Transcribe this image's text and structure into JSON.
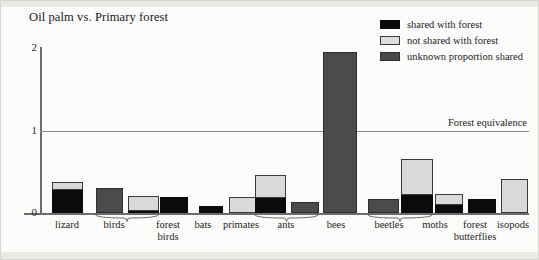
{
  "chart_data": {
    "type": "bar",
    "title": "Oil palm vs. Primary forest",
    "xlabel": "",
    "ylabel": "",
    "ylim": [
      0,
      2.1
    ],
    "yticks": [
      0,
      1,
      2
    ],
    "ytick_labels": [
      "0",
      "1",
      "2"
    ],
    "grid": false,
    "stacked": true,
    "legend_position": "top-right",
    "annotations": [
      {
        "name": "forest-equivalence",
        "label": "Forest equivalence",
        "y": 1
      }
    ],
    "legend": [
      {
        "key": "shared",
        "label": "shared with forest",
        "color": "#0b0b0b"
      },
      {
        "key": "notshared",
        "label": "not shared with forest",
        "color": "#d9d9d7"
      },
      {
        "key": "unknown",
        "label": "unknown proportion shared",
        "color": "#4b4b4b"
      }
    ],
    "categories": [
      "lizard",
      "birds",
      "forest birds",
      "bats",
      "primates",
      "ants",
      "bees",
      "beetles",
      "moths",
      "forest butterflies",
      "isopods"
    ],
    "groups": [
      {
        "label": "birds",
        "bars": 2
      },
      {
        "label": "ants",
        "bars": 2
      },
      {
        "label": "beetles",
        "bars": 2
      }
    ],
    "bars": [
      {
        "name": "lizard",
        "label": "lizard",
        "shared": 0.28,
        "notshared": 0.09,
        "unknown": 0,
        "total": 0.37
      },
      {
        "name": "birds-1",
        "label": "birds",
        "shared": 0,
        "notshared": 0,
        "unknown": 0.3,
        "total": 0.3
      },
      {
        "name": "birds-2",
        "label": "birds",
        "shared": 0.02,
        "notshared": 0.19,
        "unknown": 0,
        "total": 0.21
      },
      {
        "name": "forest-birds",
        "label": "forest birds",
        "shared": 0.2,
        "notshared": 0,
        "unknown": 0,
        "total": 0.2
      },
      {
        "name": "bats",
        "label": "bats",
        "shared": 0.09,
        "notshared": 0,
        "unknown": 0,
        "total": 0.09
      },
      {
        "name": "primates",
        "label": "primates",
        "shared": 0,
        "notshared": 0.2,
        "unknown": 0,
        "total": 0.2
      },
      {
        "name": "ants-1",
        "label": "ants",
        "shared": 0.18,
        "notshared": 0.28,
        "unknown": 0,
        "total": 0.46
      },
      {
        "name": "ants-2",
        "label": "ants",
        "shared": 0,
        "notshared": 0,
        "unknown": 0.13,
        "total": 0.13
      },
      {
        "name": "bees",
        "label": "bees",
        "shared": 0,
        "notshared": 0,
        "unknown": 1.95,
        "total": 1.95
      },
      {
        "name": "beetles-1",
        "label": "beetles",
        "shared": 0,
        "notshared": 0,
        "unknown": 0.17,
        "total": 0.17
      },
      {
        "name": "beetles-2",
        "label": "beetles",
        "shared": 0.22,
        "notshared": 0.44,
        "unknown": 0,
        "total": 0.66
      },
      {
        "name": "moths",
        "label": "moths",
        "shared": 0.1,
        "notshared": 0.13,
        "unknown": 0,
        "total": 0.23
      },
      {
        "name": "forest-butterflies",
        "label": "forest butterflies",
        "shared": 0.17,
        "notshared": 0,
        "unknown": 0,
        "total": 0.17
      },
      {
        "name": "isopods",
        "label": "isopods",
        "shared": 0,
        "notshared": 0.41,
        "unknown": 0,
        "total": 0.41
      }
    ],
    "axis_labels": [
      {
        "name": "lizard",
        "line1": "lizard",
        "line2": "",
        "x": 66
      },
      {
        "name": "birds",
        "line1": "birds",
        "line2": "",
        "x": 113
      },
      {
        "name": "forest-birds",
        "line1": "forest",
        "line2": "birds",
        "x": 167
      },
      {
        "name": "bats",
        "line1": "bats",
        "line2": "",
        "x": 202
      },
      {
        "name": "primates",
        "line1": "primates",
        "line2": "",
        "x": 240
      },
      {
        "name": "ants",
        "line1": "ants",
        "line2": "",
        "x": 285
      },
      {
        "name": "bees",
        "line1": "bees",
        "line2": "",
        "x": 335
      },
      {
        "name": "beetles",
        "line1": "beetles",
        "line2": "",
        "x": 388
      },
      {
        "name": "moths",
        "line1": "moths",
        "line2": "",
        "x": 434
      },
      {
        "name": "forest-butterflies",
        "line1": "forest",
        "line2": "butterflies",
        "x": 474
      },
      {
        "name": "isopods",
        "line1": "isopods",
        "line2": "",
        "x": 512
      }
    ]
  }
}
